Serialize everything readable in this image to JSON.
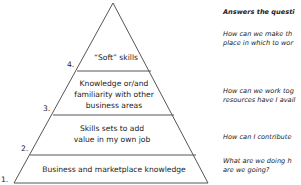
{
  "pyramid": {
    "layers": [
      {
        "number": "1.",
        "lines": [
          "Business and marketplace knowledge"
        ]
      },
      {
        "number": "2.",
        "lines": [
          "Skills sets to add",
          "value in my own job"
        ]
      },
      {
        "number": "3.",
        "lines": [
          "Knowledge or/and",
          "familiarity with other",
          "business areas"
        ]
      },
      {
        "number": "4.",
        "lines": [
          "“Soft” skills"
        ]
      }
    ]
  },
  "side_panel": {
    "title": "Answers the questi",
    "questions": [
      [
        "How can we make th",
        "place in which to wor"
      ],
      [
        "How can we work tog",
        "resources have I avail"
      ],
      [
        "How can I contribute"
      ],
      [
        "What are we doing h",
        "are we going?"
      ]
    ]
  }
}
